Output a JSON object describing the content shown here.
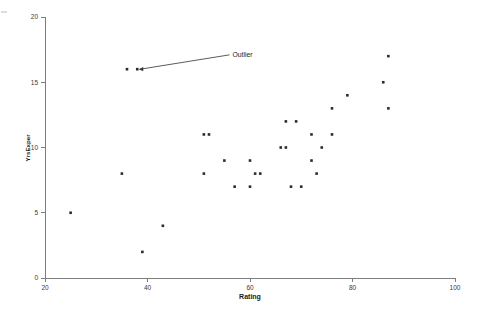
{
  "chart_data": {
    "type": "scatter",
    "title": "",
    "xlabel": "Rating",
    "ylabel": "YrsExper",
    "xlim": [
      20,
      100
    ],
    "ylim": [
      0,
      20
    ],
    "xticks": [
      20,
      40,
      60,
      80,
      100
    ],
    "yticks": [
      0,
      5,
      10,
      15,
      20
    ],
    "xtick_labels": [
      "20",
      "40",
      "60",
      "80",
      "100"
    ],
    "ytick_labels": [
      "0",
      "5",
      "10",
      "15",
      "20"
    ],
    "grid": false,
    "legend": null,
    "marker": "filled-square",
    "marker_color": "#2b2b2b",
    "points": [
      {
        "x": 25,
        "y": 5
      },
      {
        "x": 35,
        "y": 8
      },
      {
        "x": 36,
        "y": 16
      },
      {
        "x": 38,
        "y": 16
      },
      {
        "x": 39,
        "y": 2
      },
      {
        "x": 43,
        "y": 4
      },
      {
        "x": 51,
        "y": 8
      },
      {
        "x": 51,
        "y": 11
      },
      {
        "x": 52,
        "y": 11
      },
      {
        "x": 55,
        "y": 9
      },
      {
        "x": 57,
        "y": 7
      },
      {
        "x": 60,
        "y": 9
      },
      {
        "x": 60,
        "y": 7
      },
      {
        "x": 61,
        "y": 8
      },
      {
        "x": 62,
        "y": 8
      },
      {
        "x": 66,
        "y": 10
      },
      {
        "x": 67,
        "y": 10
      },
      {
        "x": 67,
        "y": 12
      },
      {
        "x": 68,
        "y": 7
      },
      {
        "x": 69,
        "y": 12
      },
      {
        "x": 70,
        "y": 7
      },
      {
        "x": 72,
        "y": 9
      },
      {
        "x": 72,
        "y": 11
      },
      {
        "x": 73,
        "y": 8
      },
      {
        "x": 74,
        "y": 10
      },
      {
        "x": 76,
        "y": 11
      },
      {
        "x": 76,
        "y": 13
      },
      {
        "x": 79,
        "y": 14
      },
      {
        "x": 86,
        "y": 15
      },
      {
        "x": 87,
        "y": 17
      },
      {
        "x": 87,
        "y": 13
      }
    ],
    "annotations": [
      {
        "text": "Outlier",
        "target_x": 38,
        "target_y": 16,
        "label_x": 56,
        "label_y": 17.1
      }
    ]
  }
}
